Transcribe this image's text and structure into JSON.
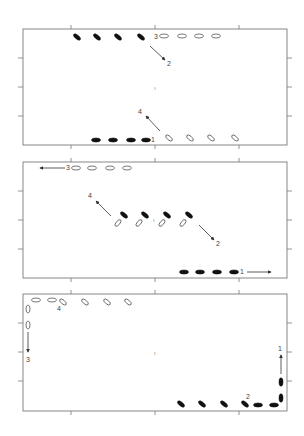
{
  "figure": {
    "colors": {
      "frame": "#7a7a7a",
      "filled": "#111111",
      "open_stroke": "#555555",
      "arrow": "#333333"
    },
    "panels": [
      {
        "id": "top",
        "labels": {
          "l1": "1",
          "l2": "2",
          "l3": "3",
          "l4": "4",
          "center": "ı"
        }
      },
      {
        "id": "middle",
        "labels": {
          "l1": "1",
          "l2": "2",
          "l3": "3",
          "l4": "4",
          "center": "ı"
        }
      },
      {
        "id": "bottom",
        "labels": {
          "l1": "1",
          "l2": "2",
          "l3": "3",
          "l4": "4",
          "center": "ı"
        }
      }
    ]
  }
}
